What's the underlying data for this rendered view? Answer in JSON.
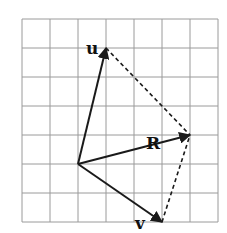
{
  "diagram": {
    "title": "",
    "grid": {
      "columns": 7,
      "rows": 7,
      "line_color": "#9a9a9a"
    },
    "origin": {
      "col": 2,
      "row": 5
    },
    "vectors": [
      {
        "id": "u",
        "label": "u",
        "dx": 1,
        "dy": 4,
        "style": "solid"
      },
      {
        "id": "R",
        "label": "R",
        "dx": 4,
        "dy": 1,
        "style": "solid"
      },
      {
        "id": "v",
        "label": "v",
        "dx": 3,
        "dy": -2,
        "style": "solid"
      }
    ],
    "construction_lines": [
      {
        "id": "u-to-R",
        "from": "u",
        "to": "R",
        "style": "dashed"
      },
      {
        "id": "v-to-R",
        "from": "v",
        "to": "R",
        "style": "dashed"
      }
    ],
    "ink_color": "#1a1a1a"
  }
}
